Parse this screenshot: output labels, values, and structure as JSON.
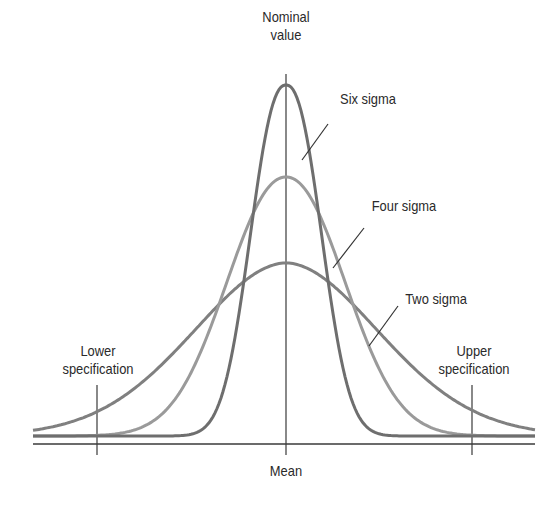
{
  "labels": {
    "nominal_line1": "Nominal",
    "nominal_line2": "value",
    "six_sigma": "Six sigma",
    "four_sigma": "Four sigma",
    "two_sigma": "Two sigma",
    "lower_line1": "Lower",
    "lower_line2": "specification",
    "upper_line1": "Upper",
    "upper_line2": "specification",
    "mean": "Mean"
  },
  "colors": {
    "six_sigma_curve": "#6e6e6e",
    "four_sigma_curve": "#9a9a9a",
    "two_sigma_curve": "#808080",
    "axis": "#3a3a3a"
  },
  "chart_data": {
    "type": "line",
    "title": "",
    "xlabel": "Mean",
    "ylabel": "",
    "series": [
      {
        "name": "Six sigma",
        "relative_peak": 1.0,
        "relative_spread": 0.33
      },
      {
        "name": "Four sigma",
        "relative_peak": 0.73,
        "relative_spread": 0.55
      },
      {
        "name": "Two sigma",
        "relative_peak": 0.49,
        "relative_spread": 1.0
      }
    ],
    "annotations": [
      "Nominal value",
      "Lower specification",
      "Upper specification",
      "Mean"
    ],
    "grid": false
  }
}
